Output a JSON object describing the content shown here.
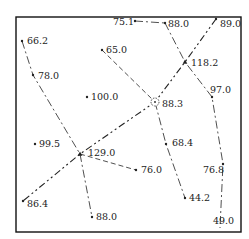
{
  "diagram": {
    "frame": {
      "x": 16,
      "y": 17,
      "w": 225,
      "h": 215
    },
    "points": [
      {
        "id": "p1",
        "label": "66.2",
        "x": 22,
        "y": 41,
        "lx": 27,
        "ly": 44,
        "marker": "dot"
      },
      {
        "id": "p2",
        "label": "78.0",
        "x": 33,
        "y": 75,
        "lx": 38,
        "ly": 79,
        "marker": "dot"
      },
      {
        "id": "p3",
        "label": "65.0",
        "x": 102,
        "y": 50,
        "lx": 106,
        "ly": 53,
        "marker": "dot"
      },
      {
        "id": "p4",
        "label": "100.0",
        "x": 87,
        "y": 97,
        "lx": 91,
        "ly": 100,
        "marker": "dot"
      },
      {
        "id": "p5",
        "label": "75.1",
        "x": 135,
        "y": 21,
        "lx": 113,
        "ly": 25,
        "marker": "dot"
      },
      {
        "id": "p6",
        "label": "88.0",
        "x": 165,
        "y": 23,
        "lx": 168,
        "ly": 27,
        "marker": "dot"
      },
      {
        "id": "p7",
        "label": "89.0",
        "x": 216,
        "y": 19,
        "lx": 220,
        "ly": 27,
        "marker": "dot"
      },
      {
        "id": "p8",
        "label": "118.2",
        "x": 185,
        "y": 62,
        "lx": 191,
        "ly": 66,
        "marker": "triangle"
      },
      {
        "id": "p9",
        "label": "97.0",
        "x": 212,
        "y": 97,
        "lx": 210,
        "ly": 93,
        "marker": "dot"
      },
      {
        "id": "p10",
        "label": "88.3",
        "x": 155,
        "y": 102,
        "lx": 162,
        "ly": 107,
        "marker": "circle"
      },
      {
        "id": "p11",
        "label": "99.5",
        "x": 35,
        "y": 144,
        "lx": 39,
        "ly": 147,
        "marker": "dot"
      },
      {
        "id": "p12",
        "label": "129.0",
        "x": 80,
        "y": 154,
        "lx": 88,
        "ly": 156,
        "marker": "triangle"
      },
      {
        "id": "p13",
        "label": "76.0",
        "x": 136,
        "y": 170,
        "lx": 141,
        "ly": 173,
        "marker": "dot"
      },
      {
        "id": "p14",
        "label": "68.4",
        "x": 166,
        "y": 144,
        "lx": 172,
        "ly": 146,
        "marker": "dot"
      },
      {
        "id": "p15",
        "label": "76.8",
        "x": 223,
        "y": 164,
        "lx": 203,
        "ly": 173,
        "marker": "dot"
      },
      {
        "id": "p16",
        "label": "44.2",
        "x": 185,
        "y": 198,
        "lx": 189,
        "ly": 201,
        "marker": "dot"
      },
      {
        "id": "p17",
        "label": "86.4",
        "x": 23,
        "y": 201,
        "lx": 27,
        "ly": 207,
        "marker": "dot"
      },
      {
        "id": "p18",
        "label": "88.0",
        "x": 92,
        "y": 217,
        "lx": 96,
        "ly": 220,
        "marker": "dot"
      },
      {
        "id": "p19",
        "label": "49.0",
        "x": 220,
        "y": 225,
        "lx": 213,
        "ly": 224,
        "marker": "none"
      }
    ],
    "lines": [
      {
        "id": "l1",
        "pts": [
          [
            22,
            41
          ],
          [
            33,
            75
          ],
          [
            80,
            154
          ]
        ],
        "dash": "8 3 2 3",
        "width": 0.8
      },
      {
        "id": "l2",
        "pts": [
          [
            102,
            50
          ],
          [
            155,
            102
          ]
        ],
        "dash": "5 3",
        "width": 0.8
      },
      {
        "id": "l3",
        "pts": [
          [
            135,
            21
          ],
          [
            165,
            23
          ]
        ],
        "dash": "8 3 2 3",
        "width": 0.8
      },
      {
        "id": "l4",
        "pts": [
          [
            165,
            23
          ],
          [
            185,
            62
          ],
          [
            212,
            97
          ],
          [
            223,
            164
          ],
          [
            220,
            228
          ]
        ],
        "dash": "8 3 2 3",
        "width": 0.8
      },
      {
        "id": "l5",
        "pts": [
          [
            216,
            19
          ],
          [
            185,
            62
          ],
          [
            155,
            102
          ],
          [
            80,
            154
          ],
          [
            23,
            201
          ]
        ],
        "dash": "7 3 2 3 2 3",
        "width": 1.1
      },
      {
        "id": "l6",
        "pts": [
          [
            80,
            154
          ],
          [
            136,
            170
          ]
        ],
        "dash": "5 3",
        "width": 0.8
      },
      {
        "id": "l7",
        "pts": [
          [
            80,
            154
          ],
          [
            92,
            217
          ]
        ],
        "dash": "8 3 2 3",
        "width": 0.8
      },
      {
        "id": "l8",
        "pts": [
          [
            155,
            102
          ],
          [
            166,
            144
          ],
          [
            185,
            198
          ]
        ],
        "dash": "8 3 2 3",
        "width": 0.8
      }
    ],
    "colors": {
      "ink": "#222222",
      "frame": "#111111",
      "background": "#ffffff"
    }
  }
}
